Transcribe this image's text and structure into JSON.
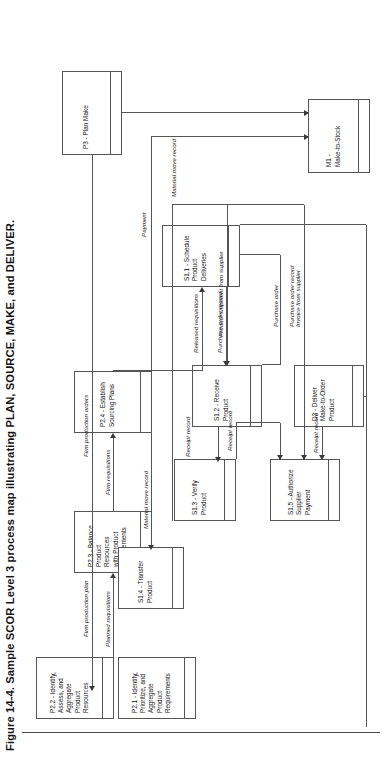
{
  "figure": {
    "caption": "Figure 14-4. Sample SCOR Level 3 process map illustrating PLAN, SOURCE, MAKE, and DELIVER.",
    "orientation": "rotated-90-ccw",
    "frame_color": "#555555"
  },
  "boxes": {
    "p3": {
      "label": "P3 - Plan Make"
    },
    "p21": {
      "label": "P2.1 - Identify,\nPrioritize, and\nAggregate\nProduct\nRequirements"
    },
    "p22": {
      "label": "P2.2 - Identify,\nAssess, and\nAggregate\nProduct\nResources"
    },
    "p23": {
      "label": "P2.3 - Balance\nProduct\nResources\nwith Product\nRequirements"
    },
    "p24": {
      "label": "P2.4 - Establish\nSourcing Plans"
    },
    "s11": {
      "label": "S1.1 - Schedule\nProduct\nDeliveries"
    },
    "s12": {
      "label": "S1.2 - Receive\nProduct"
    },
    "s13": {
      "label": "S1.3 - Verify\nProduct"
    },
    "s14": {
      "label": "S1.4 - Transfer\nProduct"
    },
    "s15": {
      "label": "S1.5 - Authorize\nSupplier\nPayment"
    },
    "d2": {
      "label": "D2 - Deliver\nMake-to-Order\nProduct"
    },
    "m1": {
      "label": "M1 -\nMake-to-Stock"
    }
  },
  "flows": {
    "firm_production_orders": "Firm production orders",
    "firm_production_plan": "Firm production plan",
    "material_move_record_m1": "Material move record",
    "material_move_record_s14": "Material move record",
    "planned_requisitions": "Planned requisitions",
    "firm_requisitions": "Firm requisitions",
    "released_requisitions": "Released requisitions",
    "purchase_order": "Purchase order",
    "purchase_order_record_a": "Purchase order record",
    "purchase_order_record_b": "Purchase order record",
    "product_shipment": "Product shipment from supplier",
    "receipt_record_a": "Receipt record",
    "receipt_record_b": "Receipt record",
    "receipt_record_c": "Receipt record",
    "invoice_from_supplier": "Invoice from supplier",
    "payment": "Payment"
  }
}
